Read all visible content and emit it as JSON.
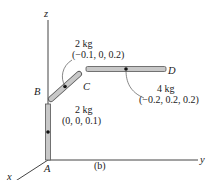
{
  "figure_label": "(b)",
  "axes": {
    "x": "x",
    "y": "y",
    "z": "z"
  },
  "points": {
    "A": "A",
    "B": "B",
    "C": "C",
    "D": "D"
  },
  "rods": [
    {
      "id": "AB",
      "mass": "2 kg",
      "centroid": "(0, 0, 0.1)"
    },
    {
      "id": "BC",
      "mass": "2 kg",
      "centroid": "(−0.1, 0, 0.2)"
    },
    {
      "id": "CD",
      "mass": "4 kg",
      "centroid": "(−0.2, 0.2, 0.2)"
    }
  ],
  "colors": {
    "rod_fill": "#c8c8c8",
    "rod_stroke": "#555555",
    "axis": "#444444",
    "text": "#222222"
  }
}
